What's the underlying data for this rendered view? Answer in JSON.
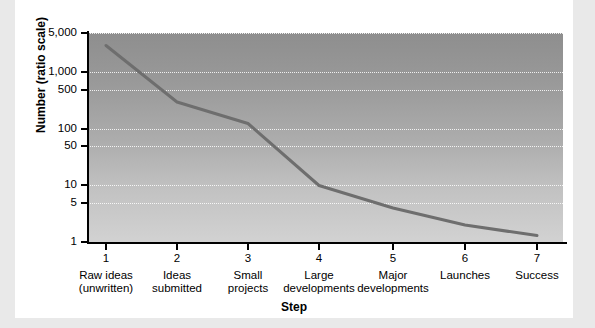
{
  "chart_data": {
    "type": "line",
    "title": "",
    "xlabel": "Step",
    "ylabel": "Number (ratio scale)",
    "yscale": "log",
    "ylim": [
      1,
      5000
    ],
    "grid": true,
    "legend": "none",
    "x": [
      1,
      2,
      3,
      4,
      5,
      6,
      7
    ],
    "categories": [
      "Raw ideas (unwritten)",
      "Ideas submitted",
      "Small projects",
      "Large developments",
      "Major developments",
      "Launches",
      "Success"
    ],
    "values": [
      3000,
      300,
      125,
      10,
      4,
      2,
      1.3
    ],
    "series": [
      {
        "name": "Number at each step",
        "values": [
          3000,
          300,
          125,
          10,
          4,
          2,
          1.3
        ]
      }
    ],
    "y_ticks": [
      {
        "label": "5,000",
        "value": 5000
      },
      {
        "label": "1,000",
        "value": 1000
      },
      {
        "label": "500",
        "value": 500
      },
      {
        "label": "100",
        "value": 100
      },
      {
        "label": "50",
        "value": 50
      },
      {
        "label": "10",
        "value": 10
      },
      {
        "label": "5",
        "value": 5
      },
      {
        "label": "1",
        "value": 1
      }
    ],
    "x_ticks": [
      {
        "number": "1",
        "line1": "Raw ideas",
        "line2": "(unwritten)"
      },
      {
        "number": "2",
        "line1": "Ideas",
        "line2": "submitted"
      },
      {
        "number": "3",
        "line1": "Small",
        "line2": "projects"
      },
      {
        "number": "4",
        "line1": "Large",
        "line2": "developments"
      },
      {
        "number": "5",
        "line1": "Major",
        "line2": "developments"
      },
      {
        "number": "6",
        "line1": "Launches",
        "line2": ""
      },
      {
        "number": "7",
        "line1": "Success",
        "line2": ""
      }
    ],
    "colors": {
      "series_line": "#6e6e6e",
      "axis": "#000000",
      "plot_background_top": "#8e8e8e",
      "plot_background_bottom": "#d2d2d2",
      "gridline": "#ffffff",
      "page_background": "#ffffff",
      "page_margin": "#e9e9e9"
    }
  }
}
